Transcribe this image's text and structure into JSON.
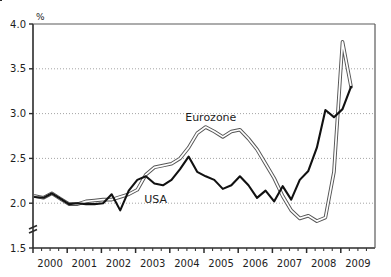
{
  "page": {
    "clipped_header_text": "",
    "background_color": "#ffffff"
  },
  "chart_data": {
    "type": "line",
    "title": "",
    "subtitle": "",
    "xlabel": "",
    "ylabel": "",
    "unit_label": "%",
    "grid": true,
    "grid_axis": "y",
    "legend_position": "inline-annotation",
    "axis_break": true,
    "axis_break_between": [
      1.5,
      2.0
    ],
    "xlim": [
      2000.0,
      2010.0
    ],
    "ylim": [
      1.5,
      4.0
    ],
    "yticks": [
      "4.0",
      "3.5",
      "3.0",
      "2.5",
      "2.0",
      "1.5"
    ],
    "ytick_values": [
      4.0,
      3.5,
      3.0,
      2.5,
      2.0,
      1.5
    ],
    "xticks": [
      "2000",
      "2001",
      "2002",
      "2003",
      "2004",
      "2005",
      "2006",
      "2007",
      "2008",
      "2009"
    ],
    "xtick_values": [
      2000,
      2001,
      2002,
      2003,
      2004,
      2005,
      2006,
      2007,
      2008,
      2009
    ],
    "minor_xticks_per_year": 4,
    "series": [
      {
        "name": "Eurozone",
        "style": "double-outline",
        "color": "#555555",
        "label_x": 2004.45,
        "label_y": 2.92,
        "x": [
          2000.05,
          2000.3,
          2000.55,
          2000.8,
          2001.05,
          2001.3,
          2001.55,
          2001.8,
          2002.05,
          2002.3,
          2002.55,
          2002.8,
          2003.05,
          2003.3,
          2003.55,
          2003.8,
          2004.05,
          2004.3,
          2004.55,
          2004.8,
          2005.05,
          2005.3,
          2005.55,
          2005.8,
          2006.05,
          2006.3,
          2006.55,
          2006.8,
          2007.05,
          2007.3,
          2007.55,
          2007.8,
          2008.05,
          2008.3,
          2008.55,
          2008.8,
          2009.05,
          2009.3
        ],
        "values": [
          2.08,
          2.06,
          2.11,
          2.05,
          1.99,
          1.99,
          2.02,
          2.03,
          2.04,
          2.04,
          2.07,
          2.1,
          2.15,
          2.32,
          2.4,
          2.42,
          2.44,
          2.5,
          2.62,
          2.78,
          2.85,
          2.8,
          2.74,
          2.8,
          2.82,
          2.72,
          2.6,
          2.44,
          2.28,
          2.08,
          1.92,
          1.83,
          1.86,
          1.8,
          1.84,
          2.35,
          3.8,
          3.3
        ]
      },
      {
        "name": "USA",
        "style": "solid-bold",
        "color": "#111111",
        "label_x": 2003.25,
        "label_y": 2.0,
        "x": [
          2000.05,
          2000.3,
          2000.55,
          2000.8,
          2001.05,
          2001.3,
          2001.55,
          2001.8,
          2002.05,
          2002.3,
          2002.55,
          2002.8,
          2003.05,
          2003.3,
          2003.55,
          2003.8,
          2004.05,
          2004.3,
          2004.55,
          2004.8,
          2005.05,
          2005.3,
          2005.55,
          2005.8,
          2006.05,
          2006.3,
          2006.55,
          2006.8,
          2007.05,
          2007.3,
          2007.55,
          2007.8,
          2008.05,
          2008.3,
          2008.55,
          2008.8,
          2009.05,
          2009.3
        ],
        "values": [
          2.07,
          2.06,
          2.11,
          2.05,
          1.99,
          2.0,
          1.99,
          1.99,
          2.0,
          2.1,
          1.92,
          2.14,
          2.26,
          2.3,
          2.22,
          2.2,
          2.26,
          2.38,
          2.52,
          2.35,
          2.3,
          2.26,
          2.16,
          2.2,
          2.3,
          2.2,
          2.06,
          2.14,
          2.02,
          2.19,
          2.04,
          2.26,
          2.36,
          2.62,
          3.04,
          2.96,
          3.05,
          3.3
        ]
      }
    ]
  },
  "plot_geometry": {
    "left": 33,
    "right": 375,
    "top": 24,
    "bottom": 248
  }
}
